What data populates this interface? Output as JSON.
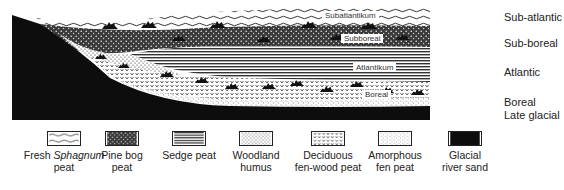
{
  "diagram": {
    "layers": [
      {
        "id": "sub_atlantic",
        "material": "fresh_sphagnum",
        "inner_label": "Subatlantikum",
        "period": "Sub-atlantic"
      },
      {
        "id": "sub_boreal",
        "material": "pine_bog",
        "inner_label": "Subboreal",
        "period": "Sub-boreal"
      },
      {
        "id": "atlantic",
        "material": "sedge",
        "inner_label": "Atlantikum",
        "period": "Atlantic"
      },
      {
        "id": "boreal",
        "material": "deciduous_fen_wood",
        "inner_label": "Boreal",
        "period": "Boreal"
      },
      {
        "id": "late_glacial",
        "material": "glacial_river_sand",
        "inner_label": "",
        "period": "Late glacial"
      }
    ]
  },
  "legend": [
    {
      "id": "fresh_sphagnum",
      "line1_a": "Fresh ",
      "line1_italic": "Sphagnum",
      "line2": "peat"
    },
    {
      "id": "pine_bog",
      "line1_a": "Pine bog",
      "line1_italic": "",
      "line2": "peat"
    },
    {
      "id": "sedge",
      "line1_a": "Sedge peat",
      "line1_italic": "",
      "line2": ""
    },
    {
      "id": "woodland_humus",
      "line1_a": "Woodland",
      "line1_italic": "",
      "line2": "humus"
    },
    {
      "id": "deciduous_fen_wood",
      "line1_a": "Deciduous",
      "line1_italic": "",
      "line2": "fen-wood peat"
    },
    {
      "id": "amorphous_fen",
      "line1_a": "Amorphous",
      "line1_italic": "",
      "line2": "fen peat"
    },
    {
      "id": "glacial_river_sand",
      "line1_a": "Glacial",
      "line1_italic": "",
      "line2": "river sand"
    }
  ],
  "colors": {
    "ink": "#111111",
    "paper": "#ffffff"
  }
}
